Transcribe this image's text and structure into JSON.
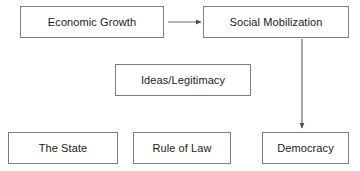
{
  "diagram": {
    "title": "",
    "background_color": "#ffffff",
    "border_color": "#7d7d7d",
    "text_color": "#1a1a1a",
    "arrow_color": "#4d4d4d",
    "nodes": [
      {
        "id": "economic-growth",
        "label": "Economic Growth"
      },
      {
        "id": "social-mobilization",
        "label": "Social Mobilization"
      },
      {
        "id": "ideas-legitimacy",
        "label": "Ideas/Legitimacy"
      },
      {
        "id": "the-state",
        "label": "The State"
      },
      {
        "id": "rule-of-law",
        "label": "Rule of Law"
      },
      {
        "id": "democracy",
        "label": "Democracy"
      }
    ],
    "edges": [
      {
        "id": "growth-to-mobilization",
        "from": "economic-growth",
        "to": "social-mobilization",
        "direction": "right",
        "style": "solid-arrow"
      },
      {
        "id": "mobilization-to-democracy",
        "from": "social-mobilization",
        "to": "democracy",
        "direction": "down",
        "style": "solid-arrow"
      }
    ]
  }
}
